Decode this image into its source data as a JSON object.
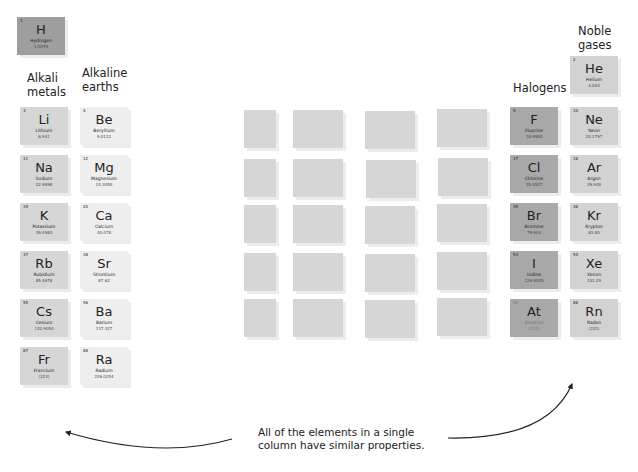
{
  "colors": {
    "hydrogen": "#9e9e9e",
    "alkali": "#d6d6d6",
    "alkaline": "#eeeeee",
    "halogen": "#a8a8a8",
    "noble": "#d2d2d2",
    "blank": "#d6d6d6"
  },
  "labels": {
    "alkali": [
      "Alkali",
      "metals"
    ],
    "alkaline": [
      "Alkaline",
      "earths"
    ],
    "halogens": "Halogens",
    "noble": [
      "Noble",
      "gases"
    ]
  },
  "caption": [
    "All of the elements in a single",
    "column have similar properties."
  ],
  "hydrogen": {
    "num": "1",
    "sym": "H",
    "name": "Hydrogen",
    "mass": "1.0079"
  },
  "alkali": [
    {
      "num": "3",
      "sym": "Li",
      "name": "Lithium",
      "mass": "6.941"
    },
    {
      "num": "11",
      "sym": "Na",
      "name": "Sodium",
      "mass": "22.9898"
    },
    {
      "num": "19",
      "sym": "K",
      "name": "Potassium",
      "mass": "39.0983"
    },
    {
      "num": "37",
      "sym": "Rb",
      "name": "Rubidium",
      "mass": "85.4678"
    },
    {
      "num": "55",
      "sym": "Cs",
      "name": "Cesium",
      "mass": "132.9054"
    },
    {
      "num": "87",
      "sym": "Fr",
      "name": "Francium",
      "mass": "(223)"
    }
  ],
  "alkaline": [
    {
      "num": "4",
      "sym": "Be",
      "name": "Beryllium",
      "mass": "9.0122"
    },
    {
      "num": "12",
      "sym": "Mg",
      "name": "Magnesium",
      "mass": "24.3050"
    },
    {
      "num": "20",
      "sym": "Ca",
      "name": "Calcium",
      "mass": "40.078"
    },
    {
      "num": "38",
      "sym": "Sr",
      "name": "Strontium",
      "mass": "87.62"
    },
    {
      "num": "56",
      "sym": "Ba",
      "name": "Barium",
      "mass": "137.327"
    },
    {
      "num": "88",
      "sym": "Ra",
      "name": "Radium",
      "mass": "226.0254"
    }
  ],
  "halogens": [
    {
      "num": "9",
      "sym": "F",
      "name": "Fluorine",
      "mass": "18.9984"
    },
    {
      "num": "17",
      "sym": "Cl",
      "name": "Chlorine",
      "mass": "35.4527"
    },
    {
      "num": "35",
      "sym": "Br",
      "name": "Bromine",
      "mass": "79.904"
    },
    {
      "num": "53",
      "sym": "I",
      "name": "Iodine",
      "mass": "126.9045"
    },
    {
      "num": "85",
      "sym": "At",
      "name": "Astatine",
      "mass": "(210)"
    }
  ],
  "noble": [
    {
      "num": "2",
      "sym": "He",
      "name": "Helium",
      "mass": "4.003"
    },
    {
      "num": "10",
      "sym": "Ne",
      "name": "Neon",
      "mass": "20.1797"
    },
    {
      "num": "18",
      "sym": "Ar",
      "name": "Argon",
      "mass": "39.948"
    },
    {
      "num": "36",
      "sym": "Kr",
      "name": "Krypton",
      "mass": "83.80"
    },
    {
      "num": "54",
      "sym": "Xe",
      "name": "Xenon",
      "mass": "131.29"
    },
    {
      "num": "86",
      "sym": "Rn",
      "name": "Radon",
      "mass": "(222)"
    }
  ]
}
